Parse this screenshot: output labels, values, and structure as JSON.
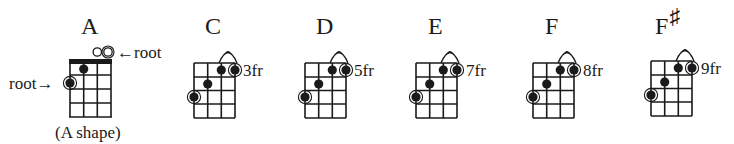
{
  "figure": {
    "grid": {
      "strings": 4,
      "frets_shown": 4
    },
    "colors": {
      "ink": "#1a1a1a",
      "background": "#ffffff",
      "root_ring": "#1a1a1a"
    }
  },
  "chords": [
    {
      "name": "A",
      "sharp": "",
      "fret_label": "",
      "shape_caption": "(A shape)",
      "has_nut": true,
      "barre_arch": false,
      "open_strings": [
        {
          "string": 3,
          "root": false
        },
        {
          "string": 4,
          "root": true
        }
      ],
      "dots": [
        {
          "string": 2,
          "fret": 1,
          "root": false
        },
        {
          "string": 1,
          "fret": 2,
          "root": true
        }
      ],
      "annotations": {
        "root_right": "←root",
        "root_left": "root→"
      }
    },
    {
      "name": "C",
      "sharp": "",
      "fret_label": "3fr",
      "has_nut": false,
      "barre_arch": true,
      "dots": [
        {
          "string": 4,
          "fret": 1,
          "root": true
        },
        {
          "string": 3,
          "fret": 1,
          "root": false
        },
        {
          "string": 2,
          "fret": 2,
          "root": false
        },
        {
          "string": 1,
          "fret": 3,
          "root": true
        }
      ]
    },
    {
      "name": "D",
      "sharp": "",
      "fret_label": "5fr",
      "has_nut": false,
      "barre_arch": true,
      "dots": [
        {
          "string": 4,
          "fret": 1,
          "root": true
        },
        {
          "string": 3,
          "fret": 1,
          "root": false
        },
        {
          "string": 2,
          "fret": 2,
          "root": false
        },
        {
          "string": 1,
          "fret": 3,
          "root": true
        }
      ]
    },
    {
      "name": "E",
      "sharp": "",
      "fret_label": "7fr",
      "has_nut": false,
      "barre_arch": true,
      "dots": [
        {
          "string": 4,
          "fret": 1,
          "root": true
        },
        {
          "string": 3,
          "fret": 1,
          "root": false
        },
        {
          "string": 2,
          "fret": 2,
          "root": false
        },
        {
          "string": 1,
          "fret": 3,
          "root": true
        }
      ]
    },
    {
      "name": "F",
      "sharp": "",
      "fret_label": "8fr",
      "has_nut": false,
      "barre_arch": true,
      "dots": [
        {
          "string": 4,
          "fret": 1,
          "root": true
        },
        {
          "string": 3,
          "fret": 1,
          "root": false
        },
        {
          "string": 2,
          "fret": 2,
          "root": false
        },
        {
          "string": 1,
          "fret": 3,
          "root": true
        }
      ]
    },
    {
      "name": "F",
      "sharp": "♯",
      "fret_label": "9fr",
      "has_nut": false,
      "barre_arch": true,
      "dots": [
        {
          "string": 4,
          "fret": 1,
          "root": true
        },
        {
          "string": 3,
          "fret": 1,
          "root": false
        },
        {
          "string": 2,
          "fret": 2,
          "root": false
        },
        {
          "string": 1,
          "fret": 3,
          "root": true
        }
      ]
    }
  ]
}
